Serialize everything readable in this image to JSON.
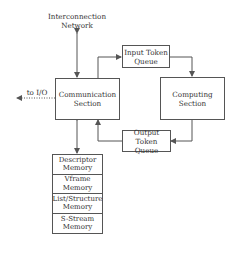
{
  "diagram": {
    "network_label_line1": "Interconnection",
    "network_label_line2": "Network",
    "io_label": "to I/O",
    "communication": {
      "line1": "Communication",
      "line2": "Section"
    },
    "computing": {
      "label": "Computing Section"
    },
    "input_queue": {
      "line1": "Input Token",
      "line2": "Queue"
    },
    "output_queue": {
      "line1": "Output Token",
      "line2": "Queue"
    },
    "memories": [
      {
        "line1": "Descriptor",
        "line2": "Memory"
      },
      {
        "line1": "Vframe",
        "line2": "Memory"
      },
      {
        "line1": "List/Structure",
        "line2": "Memory"
      },
      {
        "line1": "S-Stream",
        "line2": "Memory"
      }
    ],
    "colors": {
      "line": "#555555",
      "text": "#333333",
      "background": "#ffffff"
    }
  }
}
